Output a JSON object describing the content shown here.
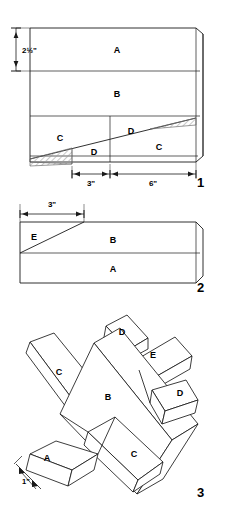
{
  "figures": [
    {
      "number": "1",
      "caption_number": "1",
      "description": "Top face layout of board showing strips A, B, C, D with cut lines",
      "dimensions": [
        {
          "id": "height-a",
          "value": "2½\"",
          "orientation": "vertical"
        },
        {
          "id": "width-left",
          "value": "3\"",
          "orientation": "horizontal"
        },
        {
          "id": "width-right",
          "value": "6\"",
          "orientation": "horizontal"
        }
      ],
      "region_labels": [
        {
          "id": "region-a",
          "text": "A"
        },
        {
          "id": "region-b",
          "text": "B"
        },
        {
          "id": "region-c-left",
          "text": "C"
        },
        {
          "id": "region-d-upper",
          "text": "D"
        },
        {
          "id": "region-d-lower",
          "text": "D"
        },
        {
          "id": "region-c-right",
          "text": "C"
        }
      ]
    },
    {
      "number": "2",
      "caption_number": "2",
      "description": "Edge view of board showing taper cut E above strips B and A",
      "dimensions": [
        {
          "id": "width-e",
          "value": "3\"",
          "orientation": "horizontal"
        }
      ],
      "region_labels": [
        {
          "id": "region-e",
          "text": "E"
        },
        {
          "id": "region-b",
          "text": "B"
        },
        {
          "id": "region-a",
          "text": "A"
        }
      ]
    },
    {
      "number": "3",
      "caption_number": "3",
      "description": "Assembled three dimensional airplane made from the lettered pieces",
      "dimensions": [
        {
          "id": "thickness-a",
          "value": "1\"",
          "orientation": "diagonal"
        }
      ],
      "region_labels": [
        {
          "id": "piece-d-top",
          "text": "D"
        },
        {
          "id": "piece-e",
          "text": "E"
        },
        {
          "id": "piece-d-right",
          "text": "D"
        },
        {
          "id": "piece-c-left",
          "text": "C"
        },
        {
          "id": "piece-b",
          "text": "B"
        },
        {
          "id": "piece-c-right",
          "text": "C"
        },
        {
          "id": "piece-a",
          "text": "A"
        }
      ]
    }
  ],
  "style": {
    "line_color": "#1a1a1a",
    "fill_color": "#ffffff",
    "hatch_color": "#8a8a8a",
    "text_color": "#000000",
    "background": "#ffffff"
  }
}
